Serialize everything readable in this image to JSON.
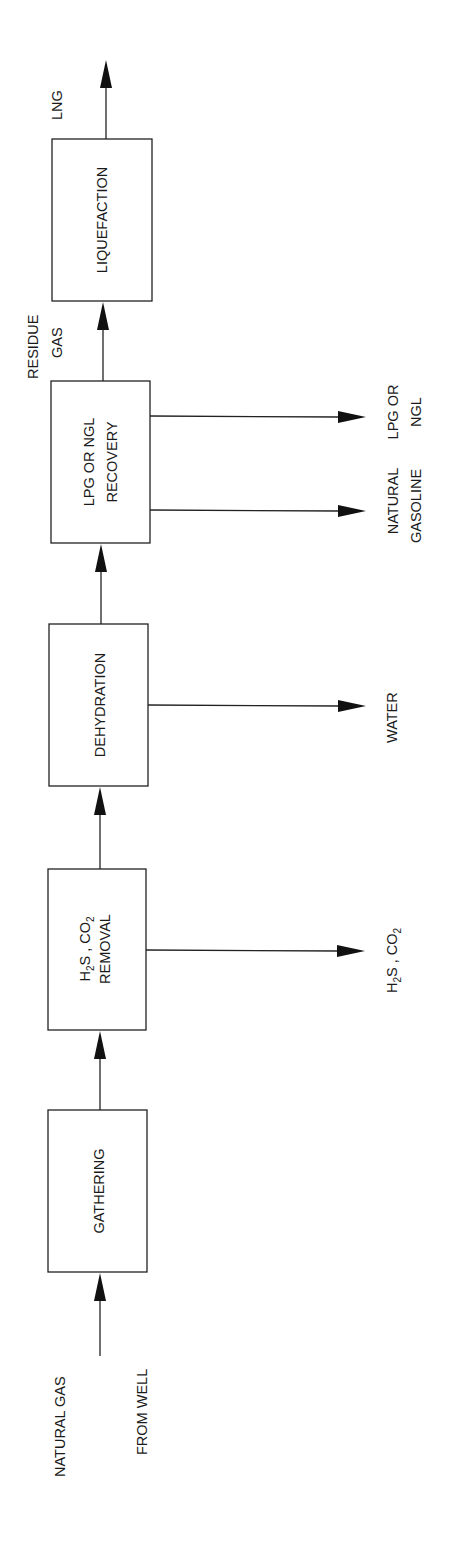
{
  "diagram": {
    "type": "process-flow",
    "orientation": "rotated-90-ccw",
    "input": {
      "line1": "NATURAL GAS",
      "line2": "FROM WELL"
    },
    "stages": [
      {
        "id": "gathering",
        "label": "GATHERING"
      },
      {
        "id": "acid-gas-removal",
        "line1_a": "H",
        "line1_a_sub": "2",
        "line1_b": "S , CO",
        "line1_b_sub": "2",
        "line2": "REMOVAL"
      },
      {
        "id": "dehydration",
        "label": "DEHYDRATION"
      },
      {
        "id": "lpg-ngl-recovery",
        "line1": "LPG OR NGL",
        "line2": "RECOVERY"
      },
      {
        "id": "liquefaction",
        "label": "LIQUEFACTION"
      }
    ],
    "byproducts": {
      "acid_gas": {
        "a": "H",
        "a_sub": "2",
        "b": "S , CO",
        "b_sub": "2"
      },
      "water": "WATER",
      "natural_gasoline": {
        "line1": "NATURAL",
        "line2": "GASOLINE"
      },
      "lpg_ngl": {
        "line1": "LPG OR",
        "line2": "NGL"
      }
    },
    "intermediate": {
      "line1": "RESIDUE",
      "line2": "GAS"
    },
    "output": "LNG"
  }
}
